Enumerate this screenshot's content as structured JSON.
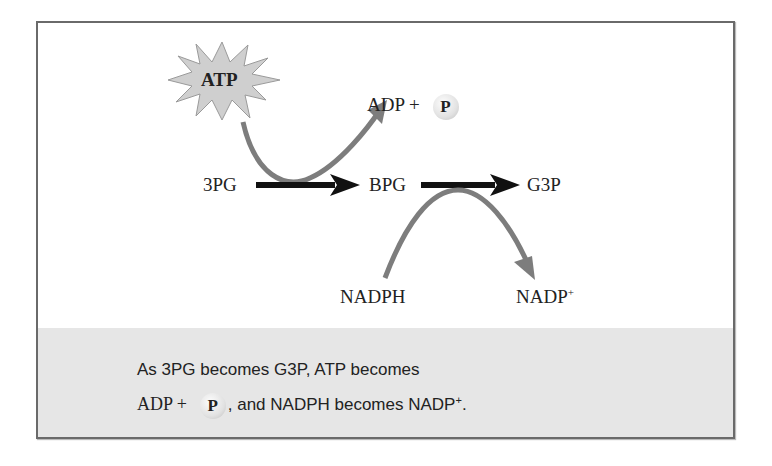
{
  "diagram": {
    "atp": "ATP",
    "adp": "ADP +",
    "phosphate": "P",
    "pg3": "3PG",
    "bpg": "BPG",
    "g3p": "G3P",
    "nadph": "NADPH",
    "nadp": "NADP",
    "nadp_sup": "+"
  },
  "caption": {
    "line1": "As 3PG becomes G3P, ATP becomes",
    "line2_adp": "ADP +",
    "line2_p": "P",
    "line2_mid": ", and NADPH becomes NADP",
    "line2_sup": "+",
    "line2_end": "."
  },
  "colors": {
    "frame": "#6a6a6a",
    "panel": "#e6e6e6",
    "curved_arrow": "#7d7d7d",
    "main_arrow": "#111111"
  }
}
